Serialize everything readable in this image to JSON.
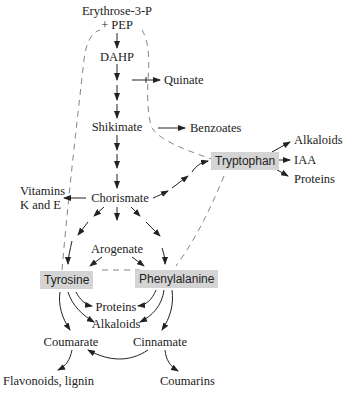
{
  "diagram": {
    "nodes": {
      "erythrose": "Erythrose-3-P",
      "pep": "+ PEP",
      "dahp": "DAHP",
      "quinate": "Quinate",
      "shikimate": "Shikimate",
      "benzoates": "Benzoates",
      "tryptophan": "Tryptophan",
      "trp_alkaloids": "Alkaloids",
      "iaa": "IAA",
      "trp_proteins": "Proteins",
      "vitamins_1": "Vitamins",
      "vitamins_2": "K and E",
      "chorismate": "Chorismate",
      "arogenate": "Arogenate",
      "tyrosine": "Tyrosine",
      "phenylalanine": "Phenylalanine",
      "proteins": "Proteins",
      "alkaloids": "Alkaloids",
      "coumarate": "Coumarate",
      "cinnamate": "Cinnamate",
      "flavonoids": "Flavonoids, lignin",
      "coumarins": "Coumarins"
    },
    "highlighted_nodes": [
      "Tryptophan",
      "Tyrosine",
      "Phenylalanine"
    ],
    "edges": [
      [
        "Erythrose-3-P + PEP",
        "DAHP"
      ],
      [
        "DAHP",
        "Quinate"
      ],
      [
        "DAHP",
        "Shikimate"
      ],
      [
        "Shikimate",
        "Benzoates"
      ],
      [
        "Shikimate",
        "Chorismate"
      ],
      [
        "Chorismate",
        "Vitamins K and E"
      ],
      [
        "Chorismate",
        "Tryptophan"
      ],
      [
        "Tryptophan",
        "Alkaloids"
      ],
      [
        "Tryptophan",
        "IAA"
      ],
      [
        "Tryptophan",
        "Proteins"
      ],
      [
        "Chorismate",
        "Arogenate"
      ],
      [
        "Chorismate",
        "Tyrosine"
      ],
      [
        "Chorismate",
        "Phenylalanine"
      ],
      [
        "Arogenate",
        "Tyrosine"
      ],
      [
        "Arogenate",
        "Phenylalanine"
      ],
      [
        "Tyrosine",
        "Proteins"
      ],
      [
        "Tyrosine",
        "Alkaloids"
      ],
      [
        "Tyrosine",
        "Coumarate"
      ],
      [
        "Phenylalanine",
        "Proteins"
      ],
      [
        "Phenylalanine",
        "Alkaloids"
      ],
      [
        "Phenylalanine",
        "Cinnamate"
      ],
      [
        "Cinnamate",
        "Coumarate"
      ],
      [
        "Coumarate",
        "Flavonoids, lignin"
      ],
      [
        "Cinnamate",
        "Coumarins"
      ]
    ],
    "box_color": "#d4d4d4"
  }
}
